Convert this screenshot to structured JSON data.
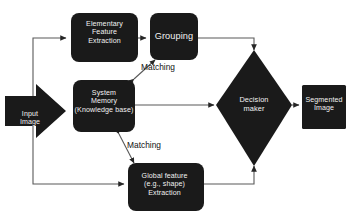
{
  "diagram": {
    "type": "flowchart",
    "colors": {
      "node_fill": "#1a1a1a",
      "node_text": "#f2f2f2",
      "connector": "#595959",
      "background": "#ffffff",
      "label_text": "#111111"
    },
    "nodes": [
      {
        "id": "input-image",
        "shape": "arrow-right",
        "line1": "Input",
        "line2": "Image"
      },
      {
        "id": "elementary-feature-extraction",
        "shape": "rounded-rect",
        "line1": "Elementary",
        "line2": "Feature",
        "line3": "Extraction"
      },
      {
        "id": "grouping",
        "shape": "rounded-rect",
        "line1": "Grouping"
      },
      {
        "id": "system-memory",
        "shape": "rounded-rect",
        "line1": "System",
        "line2": "Memory",
        "line3": "(Knowledge base)"
      },
      {
        "id": "global-feature-extraction",
        "shape": "rounded-rect",
        "line1": "Global feature",
        "line2": "(e.g., shape)",
        "line3": "Extraction"
      },
      {
        "id": "decision-maker",
        "shape": "diamond",
        "line1": "Decision",
        "line2": "maker"
      },
      {
        "id": "segmented-image",
        "shape": "rect",
        "line1": "Segmented",
        "line2": "Image"
      }
    ],
    "edge_labels": [
      {
        "id": "matching-top",
        "text": "Matching"
      },
      {
        "id": "matching-bottom",
        "text": "Matching"
      }
    ]
  }
}
